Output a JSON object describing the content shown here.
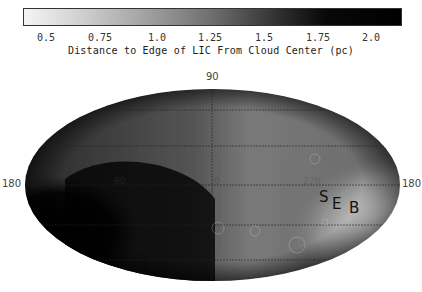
{
  "colorbar": {
    "ticks": [
      "0.5",
      "0.75",
      "1.0",
      "1.25",
      "1.5",
      "1.75",
      "2.0"
    ],
    "title": "Distance to Edge of LIC From Cloud Center (pc)",
    "range": [
      0.4,
      2.15
    ],
    "low_color": "#f4f4f4",
    "high_color": "#000000"
  },
  "map": {
    "projection": "Aitoff (galactic coordinates)",
    "labels": {
      "top": "90",
      "left": "180",
      "center": "0",
      "center_left": "90",
      "right_mid": "270",
      "right": "180"
    },
    "annotation": {
      "s": "S",
      "e": "E",
      "b": "B"
    }
  }
}
